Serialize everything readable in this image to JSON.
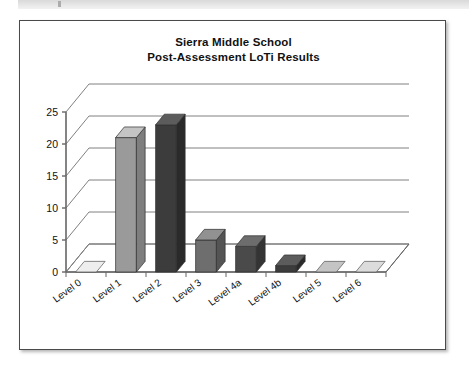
{
  "page": {
    "background_color": "#ffffff",
    "scan_strip_color": "#e0e0e0"
  },
  "card": {
    "border_color": "#4a4a4a",
    "background_color": "#ffffff"
  },
  "chart_data": {
    "type": "bar",
    "title": "Sierra Middle School",
    "subtitle": "Post-Assessment LoTi Results",
    "title_lines": [
      "Sierra Middle School",
      "Post-Assessment LoTi Results"
    ],
    "xlabel": "",
    "ylabel": "",
    "categories": [
      "Level 0",
      "Level 1",
      "Level 2",
      "Level 3",
      "Level 4a",
      "Level 4b",
      "Level 5",
      "Level 6"
    ],
    "values": [
      0,
      21,
      23,
      5,
      4,
      1,
      0,
      0
    ],
    "ylim": [
      0,
      25
    ],
    "yticks": [
      0,
      5,
      10,
      15,
      20,
      25
    ],
    "ytick_labels": [
      "0",
      "5",
      "10",
      "15",
      "20",
      "25"
    ],
    "grid": true,
    "legend": false,
    "three_d": true,
    "bar_colors": [
      "#d8d8d8",
      "#9a9a9a",
      "#3c3c3c",
      "#6e6e6e",
      "#4a4a4a",
      "#3c3c3c",
      "#9a9a9a",
      "#b8b8b8"
    ],
    "bar_top_colors": [
      "#eeeeee",
      "#c4c4c4",
      "#5c5c5c",
      "#919191",
      "#6d6d6d",
      "#5c5c5c",
      "#c4c4c4",
      "#dcdcdc"
    ],
    "bar_side_colors": [
      "#bdbdbd",
      "#7e7e7e",
      "#2a2a2a",
      "#545454",
      "#343434",
      "#2a2a2a",
      "#7e7e7e",
      "#9e9e9e"
    ],
    "gridline_color": "#808080",
    "axis_color": "#666666",
    "floor_color": "#ffffff"
  }
}
